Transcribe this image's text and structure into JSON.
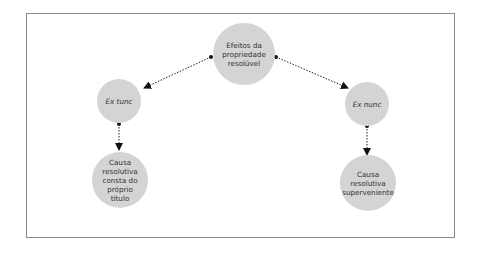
{
  "diagram": {
    "root": {
      "label": "Efeitos da propriedade resolúvel"
    },
    "left": {
      "label": "Ex tunc",
      "child": {
        "label": "Causa resolutiva consta do próprio título"
      }
    },
    "right": {
      "label": "Ex nunc",
      "child": {
        "label": "Causa resolutiva superveniente"
      }
    },
    "colors": {
      "node_fill": "#d4d4d4",
      "border": "#8a8a8a",
      "line": "#222222"
    }
  }
}
